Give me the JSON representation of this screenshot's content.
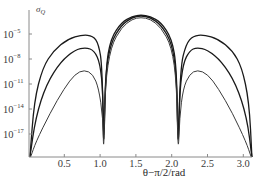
{
  "chart_data": {
    "type": "line",
    "title": "",
    "xlabel": "θ−π/2/rad",
    "ylabel": "σQ",
    "ylabel_main": "σ",
    "ylabel_sub": "Q",
    "yscale": "log",
    "xlim": [
      0,
      3.14
    ],
    "ylim_exponent": [
      -20,
      -2
    ],
    "x_ticks": [
      0.5,
      1.0,
      1.5,
      2.0,
      2.5,
      3.0
    ],
    "x_tick_labels": [
      "0.5",
      "1.0",
      "1.5",
      "2.0",
      "2.5",
      "3.0"
    ],
    "y_ticks_exponent": [
      -5,
      -8,
      -11,
      -14,
      -17
    ],
    "y_tick_labels": [
      "10^-5",
      "10^-8",
      "10^-11",
      "10^-14",
      "10^-17"
    ],
    "grid": false,
    "legend": null,
    "zeros_x": [
      0.0,
      1.05,
      2.09,
      3.14
    ],
    "series": [
      {
        "name": "curve-1 (outer)",
        "color": "#1a1a1a",
        "width": 1.3,
        "log10_points": [
          [
            0.02,
            -20
          ],
          [
            0.08,
            -13
          ],
          [
            0.2,
            -9
          ],
          [
            0.35,
            -7
          ],
          [
            0.55,
            -5.6
          ],
          [
            0.75,
            -5.1
          ],
          [
            0.9,
            -5.2
          ],
          [
            0.98,
            -6.2
          ],
          [
            1.03,
            -9
          ],
          [
            1.05,
            -20
          ],
          [
            1.08,
            -9
          ],
          [
            1.15,
            -5.5
          ],
          [
            1.3,
            -3.6
          ],
          [
            1.45,
            -2.9
          ],
          [
            1.57,
            -2.7
          ],
          [
            1.7,
            -2.9
          ],
          [
            1.85,
            -3.6
          ],
          [
            2.0,
            -5.5
          ],
          [
            2.07,
            -9
          ],
          [
            2.09,
            -20
          ],
          [
            2.12,
            -9
          ],
          [
            2.2,
            -6.2
          ],
          [
            2.3,
            -5.2
          ],
          [
            2.45,
            -5.1
          ],
          [
            2.65,
            -5.6
          ],
          [
            2.85,
            -7
          ],
          [
            2.98,
            -9
          ],
          [
            3.08,
            -13
          ],
          [
            3.12,
            -20
          ]
        ]
      },
      {
        "name": "curve-2 (middle)",
        "color": "#1a1a1a",
        "width": 1.3,
        "log10_points": [
          [
            0.02,
            -20
          ],
          [
            0.1,
            -15
          ],
          [
            0.25,
            -11
          ],
          [
            0.45,
            -8.3
          ],
          [
            0.65,
            -6.9
          ],
          [
            0.8,
            -6.6
          ],
          [
            0.92,
            -7
          ],
          [
            1.0,
            -8.5
          ],
          [
            1.04,
            -12
          ],
          [
            1.05,
            -20
          ],
          [
            1.07,
            -10
          ],
          [
            1.15,
            -6
          ],
          [
            1.3,
            -3.9
          ],
          [
            1.45,
            -3.0
          ],
          [
            1.57,
            -2.8
          ],
          [
            1.7,
            -3.0
          ],
          [
            1.85,
            -3.9
          ],
          [
            2.0,
            -6
          ],
          [
            2.07,
            -10
          ],
          [
            2.09,
            -20
          ],
          [
            2.11,
            -12
          ],
          [
            2.16,
            -8.5
          ],
          [
            2.25,
            -7
          ],
          [
            2.35,
            -6.6
          ],
          [
            2.5,
            -6.9
          ],
          [
            2.7,
            -8.3
          ],
          [
            2.9,
            -11
          ],
          [
            3.05,
            -15
          ],
          [
            3.12,
            -20
          ]
        ]
      },
      {
        "name": "curve-3 (inner)",
        "color": "#3a3a3a",
        "width": 1.0,
        "log10_points": [
          [
            0.03,
            -20
          ],
          [
            0.1,
            -18
          ],
          [
            0.3,
            -14.5
          ],
          [
            0.5,
            -11.5
          ],
          [
            0.65,
            -9.8
          ],
          [
            0.78,
            -9.3
          ],
          [
            0.9,
            -9.8
          ],
          [
            0.98,
            -11.5
          ],
          [
            1.04,
            -15
          ],
          [
            1.05,
            -20
          ],
          [
            1.07,
            -11
          ],
          [
            1.15,
            -6.5
          ],
          [
            1.3,
            -4.2
          ],
          [
            1.45,
            -3.2
          ],
          [
            1.57,
            -3.0
          ],
          [
            1.7,
            -3.2
          ],
          [
            1.85,
            -4.2
          ],
          [
            2.0,
            -6.5
          ],
          [
            2.07,
            -11
          ],
          [
            2.09,
            -20
          ],
          [
            2.11,
            -15
          ],
          [
            2.16,
            -11.5
          ],
          [
            2.25,
            -9.8
          ],
          [
            2.36,
            -9.3
          ],
          [
            2.5,
            -9.8
          ],
          [
            2.65,
            -11.5
          ],
          [
            2.85,
            -14.5
          ],
          [
            3.04,
            -18
          ],
          [
            3.11,
            -20
          ]
        ]
      }
    ]
  }
}
